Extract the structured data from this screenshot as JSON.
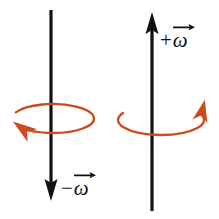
{
  "figure": {
    "type": "physics-vector-diagram",
    "background_color": "#ffffff",
    "width": 219,
    "height": 219
  },
  "colors": {
    "axis": "#111111",
    "rotation": "#CC4A1E",
    "rotation_light": "#C4643A",
    "text": "#101010",
    "background": "#ffffff"
  },
  "panels": [
    {
      "id": "negative-omega",
      "axis": {
        "x": 51,
        "y_top": 10,
        "y_bottom": 201,
        "stroke_width": 3.2,
        "arrow_direction": "down",
        "arrow_tip_y": 201,
        "arrow_width": 13,
        "arrow_length": 22
      },
      "rotation": {
        "center_x": 53,
        "center_y": 118.5,
        "radius_x": 41,
        "radius_y": 14.5,
        "stroke_width": 2.3,
        "sense": "counterclockwise-viewed-from-above",
        "gap_start_deg": 182,
        "gap_end_deg": 205,
        "arrow_position": "lower-left",
        "arrow_direction": "left"
      },
      "label": {
        "sign": "−",
        "symbol": "ω",
        "accent": "vector-arrow",
        "text": "−ω⃗",
        "x": 61,
        "y": 178
      }
    },
    {
      "id": "positive-omega",
      "axis": {
        "x": 152,
        "y_top": 12,
        "y_bottom": 211,
        "stroke_width": 3.2,
        "arrow_direction": "up",
        "arrow_tip_y": 12,
        "arrow_width": 13,
        "arrow_length": 22
      },
      "rotation": {
        "center_x": 161,
        "center_y": 120,
        "radius_x": 43,
        "radius_y": 15,
        "stroke_width": 2.3,
        "sense": "clockwise-viewed-from-above",
        "gap_start_deg": 183,
        "gap_end_deg": 208,
        "arrow_position": "upper-right",
        "arrow_direction": "up-right"
      },
      "label": {
        "sign": "+",
        "symbol": "ω",
        "accent": "vector-arrow",
        "text": "+ω⃗",
        "x": 160,
        "y": 30
      }
    }
  ]
}
